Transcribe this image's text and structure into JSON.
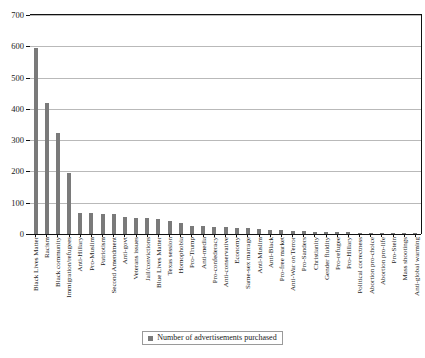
{
  "chart_data": {
    "type": "bar",
    "title": "",
    "xlabel": "",
    "ylabel": "",
    "ylim": [
      0,
      700
    ],
    "ytick_step": 100,
    "grid": true,
    "legend_position": "bottom",
    "bar_color": "#7a7a7a",
    "legend": [
      "Number of advertisements purchased"
    ],
    "yticks": [
      "0",
      "100",
      "200",
      "300",
      "400",
      "500",
      "600",
      "700"
    ],
    "categories": [
      "Black Lives Matter",
      "Racism",
      "Black community",
      "Immigration/refugees",
      "Anti-Hillary",
      "Pro-Muslim",
      "Patriotism",
      "Second Amendment",
      "Anti-govt",
      "Veterans issues",
      "Jail/convictions",
      "Blue Lives Matter",
      "Texas session",
      "Homophobia",
      "Pro-Trump",
      "Anti-media",
      "Pro-confederacy",
      "Anti-conservative",
      "Economy",
      "Same-sex marrage",
      "Anti-Muslim",
      "Anti-Black",
      "Pro-free market",
      "Anti-War on Terror",
      "Pro-Sanders",
      "Christianity",
      "Gender fluidity",
      "Pro-refugee",
      "Pro-Hillary",
      "Political correctness",
      "Abortion pro-choice",
      "Abortion pro-life",
      "Pro-Stein",
      "Mass shootings",
      "Anti-global warming"
    ],
    "values": [
      595,
      420,
      323,
      195,
      68,
      66,
      65,
      63,
      55,
      52,
      52,
      48,
      41,
      34,
      27,
      26,
      24,
      22,
      20,
      18,
      16,
      14,
      12,
      11,
      9,
      8,
      7,
      6,
      5,
      4,
      3,
      3,
      2,
      2,
      1
    ]
  },
  "legend": {
    "label": "Number of advertisements purchased"
  }
}
